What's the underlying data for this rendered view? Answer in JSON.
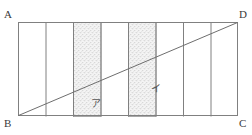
{
  "figure": {
    "vertices": {
      "top_left": "A",
      "top_right": "D",
      "bottom_left": "B",
      "bottom_right": "C"
    },
    "rectangle": {
      "x": 18,
      "y": 22,
      "width": 220,
      "height": 94,
      "stroke": "#808080"
    },
    "strip_count": 8,
    "divider_count": 7,
    "divider_stroke": "#808080",
    "diagonal": {
      "from": "B",
      "to": "D",
      "stroke": "#6e6e6e"
    },
    "shading": {
      "fill": "#f2f2f2",
      "dot_color": "#b9b9b9",
      "outline": "#a8a8a8"
    },
    "shaded_regions": [
      {
        "label": "ア",
        "strip_index": 3,
        "label_x": 91,
        "label_y": 99
      },
      {
        "label": "イ",
        "strip_index": 5,
        "label_x": 151,
        "label_y": 84
      }
    ]
  }
}
